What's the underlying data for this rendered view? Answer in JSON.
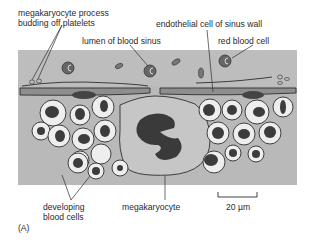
{
  "labels": {
    "megakaryocyte_process_line1": "megakaryocyte process",
    "megakaryocyte_process_line2": "budding off platelets",
    "endothelial_cell": "endothelial cell of sinus wall",
    "lumen": "lumen of blood sinus",
    "red_blood_cell": "red blood cell",
    "developing_line1": "developing",
    "developing_line2": "blood cells",
    "megakaryocyte": "megakaryocyte",
    "scale_bar": "20 µm",
    "panel": "(A)"
  },
  "colors": {
    "background": "#ffffff",
    "tissue": "#b9b9b9",
    "sinus": "#c4c4c4",
    "cell_fill": "#eeeeee",
    "nucleus": "#3c3c3c",
    "outline": "#2e2e2e",
    "endothelium": "#8a8a8a"
  }
}
